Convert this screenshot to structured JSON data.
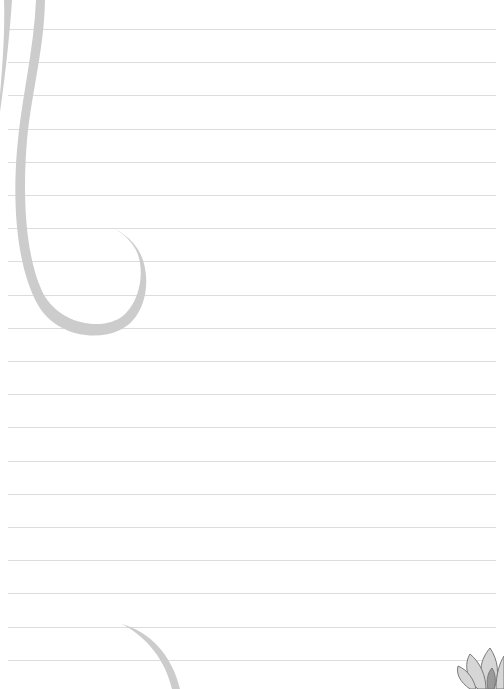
{
  "page": {
    "type": "lined-notepaper",
    "background_color": "#ffffff",
    "line_color": "#dcdcdc",
    "swirl_color": "#cccccc",
    "flower_color": "#8a8a8a"
  },
  "ruled_lines": {
    "count": 20,
    "first_y": 29,
    "spacing": 33.2,
    "x_start": 8,
    "x_end": 496
  },
  "decorations": [
    {
      "name": "swirl-top-left",
      "icon": "swirl-icon"
    },
    {
      "name": "swirl-bottom-left",
      "icon": "swirl-icon"
    },
    {
      "name": "lotus-bottom-right",
      "icon": "lotus-flower-icon"
    }
  ]
}
